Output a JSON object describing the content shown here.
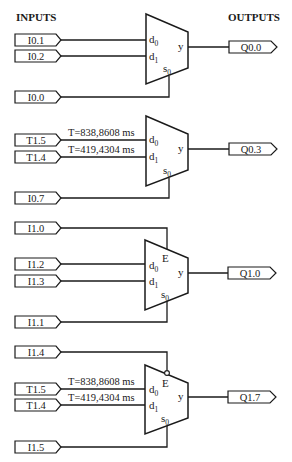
{
  "headers": {
    "inputs": "INPUTS",
    "outputs": "OUTPUTS"
  },
  "colors": {
    "line": "#1a1a1a",
    "background": "#ffffff"
  },
  "muxes": [
    {
      "name": "mux-1",
      "enable": null,
      "pins": {
        "d0": "d",
        "d0_sub": "0",
        "d1": "d",
        "d1_sub": "1",
        "s0": "s",
        "s0_sub": "0",
        "y": "y"
      },
      "inputs": {
        "d0": "I0.1",
        "d1": "I0.2",
        "s0": "I0.0"
      },
      "output": "Q0.0"
    },
    {
      "name": "mux-2",
      "enable": null,
      "pins": {
        "d0": "d",
        "d0_sub": "0",
        "d1": "d",
        "d1_sub": "1",
        "s0": "s",
        "s0_sub": "0",
        "y": "y"
      },
      "inputs": {
        "d0": "T1.5",
        "d1": "T1.4",
        "s0": "I0.7"
      },
      "timers": {
        "d0": "T=838,8608 ms",
        "d1": "T=419,4304 ms"
      },
      "output": "Q0.3"
    },
    {
      "name": "mux-3",
      "pins": {
        "E": "E",
        "d0": "d",
        "d0_sub": "0",
        "d1": "d",
        "d1_sub": "1",
        "s0": "s",
        "s0_sub": "0",
        "y": "y"
      },
      "inputs": {
        "E": "I1.0",
        "d0": "I1.2",
        "d1": "I1.3",
        "s0": "I1.1"
      },
      "enable_inverted": false,
      "output": "Q1.0"
    },
    {
      "name": "mux-4",
      "pins": {
        "E": "E",
        "d0": "d",
        "d0_sub": "0",
        "d1": "d",
        "d1_sub": "1",
        "s0": "s",
        "s0_sub": "0",
        "y": "y"
      },
      "inputs": {
        "E": "I1.4",
        "d0": "T1.5",
        "d1": "T1.4",
        "s0": "I1.5"
      },
      "timers": {
        "d0": "T=838,8608 ms",
        "d1": "T=419,4304 ms"
      },
      "enable_inverted": true,
      "output": "Q1.7"
    }
  ]
}
